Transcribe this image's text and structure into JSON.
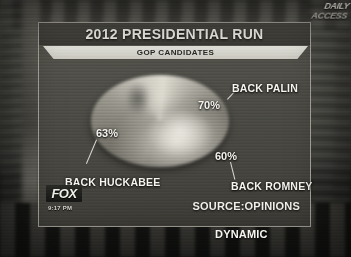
{
  "broadcast": {
    "network": "FOX",
    "clock": "9:17 PM",
    "watermark_line1": "DAILY",
    "watermark_line2": "ACCESS"
  },
  "graphic": {
    "title": "2012 PRESIDENTIAL RUN",
    "subtitle": "GOP CANDIDATES",
    "source_line1": "SOURCE:OPINIONS",
    "source_line2": "DYNAMIC"
  },
  "chart_data": {
    "type": "pie",
    "title": "2012 PRESIDENTIAL RUN",
    "subtitle": "GOP CANDIDATES",
    "categories": [
      "BACK PALIN",
      "BACK HUCKABEE",
      "BACK ROMNEY"
    ],
    "values": [
      70,
      63,
      60
    ],
    "value_labels": [
      "70%",
      "63%",
      "60%"
    ],
    "unit": "%",
    "legend": "none",
    "annotations": [
      "Percentages sum to 193%, exceeding 100%"
    ],
    "source": "SOURCE:OPINIONS DYNAMIC"
  },
  "labels": {
    "palin": {
      "name": "BACK PALIN",
      "pct": "70%"
    },
    "huckabee": {
      "name": "BACK HUCKABEE",
      "pct": "63%"
    },
    "romney": {
      "name": "BACK ROMNEY",
      "pct": "60%"
    }
  }
}
